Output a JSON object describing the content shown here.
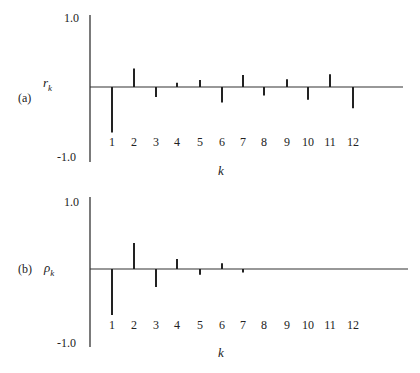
{
  "chart_data": [
    {
      "type": "bar",
      "subtype": "stem/correlogram",
      "panel_label": "(a)",
      "ylabel": "r_k",
      "ylabel_base": "r",
      "ylabel_sub": "k",
      "xlabel": "k",
      "ylim": [
        -1.0,
        1.0
      ],
      "ytick_labels": [
        "1.0",
        "-1.0"
      ],
      "categories": [
        "1",
        "2",
        "3",
        "4",
        "5",
        "6",
        "7",
        "8",
        "9",
        "10",
        "11",
        "12"
      ],
      "values": [
        -0.64,
        0.26,
        -0.14,
        0.06,
        0.1,
        -0.22,
        0.17,
        -0.12,
        0.11,
        -0.18,
        0.18,
        -0.3
      ],
      "grid": false,
      "legend": null
    },
    {
      "type": "bar",
      "subtype": "stem/correlogram",
      "panel_label": "(b)",
      "ylabel": "ρ_k",
      "ylabel_base": "ρ",
      "ylabel_sub": "k",
      "xlabel": "k",
      "ylim": [
        -1.0,
        1.0
      ],
      "ytick_labels": [
        "1.0",
        "-1.0"
      ],
      "categories": [
        "1",
        "2",
        "3",
        "4",
        "5",
        "6",
        "7",
        "8",
        "9",
        "10",
        "11",
        "12"
      ],
      "values": [
        -0.64,
        0.36,
        -0.25,
        0.14,
        -0.08,
        0.08,
        -0.05,
        0,
        0,
        0,
        0,
        0
      ],
      "grid": false,
      "legend": null
    }
  ]
}
